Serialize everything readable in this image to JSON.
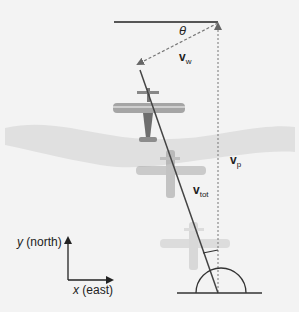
{
  "diagram": {
    "labels": {
      "theta": "θ",
      "v_w": {
        "base": "v",
        "sub": "w"
      },
      "v_p": {
        "base": "v",
        "sub": "p"
      },
      "v_tot": {
        "base": "v",
        "sub": "tot"
      }
    },
    "axes": {
      "y_label_var": "y",
      "y_label_text": " (north)",
      "x_label_var": "x",
      "x_label_text": " (east)"
    },
    "colors": {
      "background": "#f3f3f3",
      "river": "#e2e2e2",
      "line": "#333333",
      "plane": "#8a8a8a"
    }
  }
}
